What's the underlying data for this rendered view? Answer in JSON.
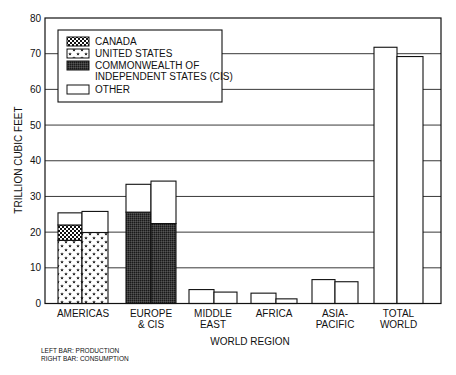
{
  "chart_data": {
    "type": "bar",
    "subtype": "grouped-stacked",
    "title": "",
    "xlabel": "WORLD REGION",
    "ylabel": "TRILLION CUBIC FEET",
    "ylim": [
      0,
      80
    ],
    "yticks": [
      0,
      10,
      20,
      30,
      40,
      50,
      60,
      70,
      80
    ],
    "grid": "horizontal",
    "legend_position": "upper-left-inside",
    "categories": [
      "AMERICAS",
      "EUROPE & CIS",
      "MIDDLE EAST",
      "AFRICA",
      "ASIA-PACIFIC",
      "TOTAL WORLD"
    ],
    "category_labels": [
      [
        "AMERICAS"
      ],
      [
        "EUROPE",
        "& CIS"
      ],
      [
        "MIDDLE",
        "EAST"
      ],
      [
        "AFRICA"
      ],
      [
        "ASIA-",
        "PACIFIC"
      ],
      [
        "TOTAL",
        "WORLD"
      ]
    ],
    "legend": [
      {
        "name": "CANADA",
        "pattern": "checker",
        "lines": [
          "CANADA"
        ]
      },
      {
        "name": "UNITED STATES",
        "pattern": "stars",
        "lines": [
          "UNITED STATES"
        ]
      },
      {
        "name": "COMMONWEALTH OF INDEPENDENT STATES (CIS)",
        "pattern": "dark",
        "lines": [
          "COMMONWEALTH OF",
          "INDEPENDENT STATES (CIS)"
        ]
      },
      {
        "name": "OTHER",
        "pattern": "white",
        "lines": [
          "OTHER"
        ]
      }
    ],
    "bars": {
      "production": [
        {
          "UNITED STATES": 17.7,
          "CANADA": 4.3,
          "OTHER": 3.4,
          "total": 25.4
        },
        {
          "COMMONWEALTH OF INDEPENDENT STATES (CIS)": 25.6,
          "OTHER": 7.8,
          "total": 33.4
        },
        {
          "OTHER": 3.9,
          "total": 3.9
        },
        {
          "OTHER": 2.9,
          "total": 2.9
        },
        {
          "OTHER": 6.7,
          "total": 6.7
        },
        {
          "OTHER": 71.8,
          "total": 71.8
        }
      ],
      "consumption": [
        {
          "UNITED STATES": 19.9,
          "OTHER": 5.9,
          "total": 25.8
        },
        {
          "COMMONWEALTH OF INDEPENDENT STATES (CIS)": 22.4,
          "OTHER": 11.9,
          "total": 34.3
        },
        {
          "OTHER": 3.2,
          "total": 3.2
        },
        {
          "OTHER": 1.3,
          "total": 1.3
        },
        {
          "OTHER": 6.1,
          "total": 6.1
        },
        {
          "OTHER": 69.2,
          "total": 69.2
        }
      ]
    },
    "series": [
      {
        "name": "Production (left bar)",
        "values": [
          25.4,
          33.4,
          3.9,
          2.9,
          6.7,
          71.8
        ]
      },
      {
        "name": "Consumption (right bar)",
        "values": [
          25.8,
          34.3,
          3.2,
          1.3,
          6.1,
          69.2
        ]
      }
    ],
    "annotations": [
      "LEFT BAR: PRODUCTION",
      "RIGHT BAR: CONSUMPTION"
    ]
  },
  "notes": {
    "left_bar": "LEFT BAR:  PRODUCTION",
    "right_bar": "RIGHT BAR:  CONSUMPTION"
  }
}
